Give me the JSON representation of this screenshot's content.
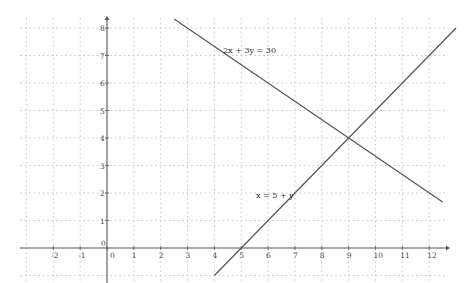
{
  "chart_data": {
    "type": "line",
    "title": "",
    "xlabel": "",
    "ylabel": "",
    "xlim": [
      -3.9,
      12.8
    ],
    "ylim": [
      -1,
      8.3
    ],
    "grid": true,
    "x_ticks": [
      -2,
      -1,
      0,
      1,
      2,
      3,
      4,
      5,
      6,
      7,
      8,
      9,
      10,
      11,
      12
    ],
    "y_ticks": [
      0,
      1,
      2,
      3,
      4,
      5,
      6,
      7,
      8
    ],
    "series": [
      {
        "name": "2x + 3y = 30",
        "equation": "2x + 3y = 30",
        "x": [
          2.5,
          12.5
        ],
        "y": [
          8.33,
          1.67
        ]
      },
      {
        "name": "x = 5 + y",
        "equation": "x = 5 + y",
        "x": [
          4,
          13
        ],
        "y": [
          -1,
          8
        ]
      }
    ],
    "annotations": [
      {
        "text": "2x + 3y = 30",
        "x": 4.3,
        "y": 7.1
      },
      {
        "text": "x = 5 + y",
        "x": 5.5,
        "y": 1.8
      }
    ],
    "intersection": {
      "x": 9,
      "y": 4
    }
  },
  "axes": {
    "origin_x_label": "0",
    "origin_y_label": "0"
  },
  "labels": {
    "line1": "2x + 3y = 30",
    "line2": "x = 5 + y"
  },
  "ticks": {
    "x": [
      "-2",
      "-1",
      "0",
      "1",
      "2",
      "3",
      "4",
      "5",
      "6",
      "7",
      "8",
      "9",
      "10",
      "11",
      "12"
    ],
    "y": [
      "1",
      "2",
      "3",
      "4",
      "5",
      "6",
      "7",
      "8"
    ]
  }
}
